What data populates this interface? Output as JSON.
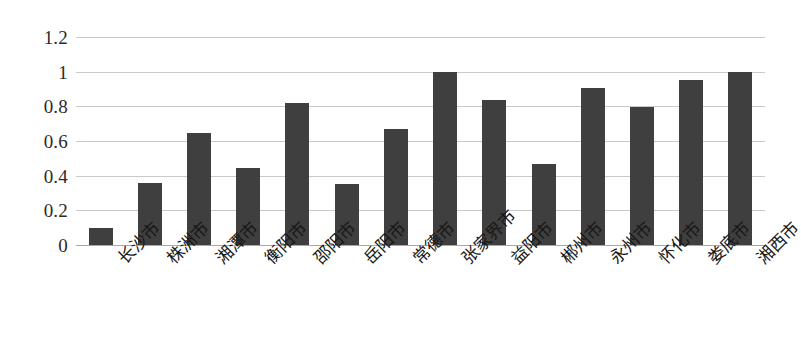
{
  "chart_data": {
    "type": "bar",
    "title": "",
    "subtitle": "",
    "xlabel": "",
    "ylabel": "",
    "categories": [
      "长沙市",
      "株洲市",
      "湘潭市",
      "衡阳市",
      "邵阳市",
      "岳阳市",
      "常德市",
      "张家界市",
      "益阳市",
      "郴州市",
      "永州市",
      "怀化市",
      "娄底市",
      "湘西市"
    ],
    "values": [
      0.1,
      0.355,
      0.645,
      0.445,
      0.82,
      0.35,
      0.67,
      1.0,
      0.835,
      0.47,
      0.905,
      0.795,
      0.95,
      1.0
    ],
    "ylim": [
      0,
      1.2
    ],
    "y_ticks": [
      "0",
      "0.2",
      "0.4",
      "0.6",
      "0.8",
      "1",
      "1.2"
    ],
    "y_tick_values": [
      0,
      0.2,
      0.4,
      0.6,
      0.8,
      1,
      1.2
    ],
    "grid": true,
    "legend": false,
    "legend_position": "none",
    "bar_color": "#3f3f3f",
    "gridline_color": "#c9c9c9",
    "axis_color": "#a8a8a8",
    "background_color": "#ffffff"
  }
}
